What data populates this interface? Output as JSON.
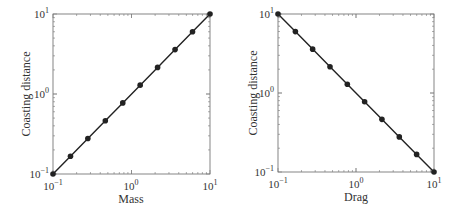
{
  "chart_data": [
    {
      "type": "line",
      "title": "",
      "xlabel": "Mass",
      "ylabel": "Coasting distance",
      "xscale": "log",
      "yscale": "log",
      "xlim": [
        0.1,
        10
      ],
      "ylim": [
        0.1,
        10
      ],
      "xticks": [
        "10^-1",
        "10^0",
        "10^1"
      ],
      "yticks": [
        "10^-1",
        "10^0",
        "10^1"
      ],
      "grid": false,
      "legend": null,
      "series": [
        {
          "name": "coasting distance vs mass",
          "marker": "circle",
          "x": [
            0.1,
            0.167,
            0.278,
            0.464,
            0.774,
            1.29,
            2.15,
            3.59,
            5.99,
            10
          ],
          "y": [
            0.1,
            0.167,
            0.278,
            0.464,
            0.774,
            1.29,
            2.15,
            3.59,
            5.99,
            10
          ]
        }
      ]
    },
    {
      "type": "line",
      "title": "",
      "xlabel": "Drag",
      "ylabel": "Coasting distance",
      "xscale": "log",
      "yscale": "log",
      "xlim": [
        0.1,
        10
      ],
      "ylim": [
        0.1,
        10
      ],
      "xticks": [
        "10^-1",
        "10^0",
        "10^1"
      ],
      "yticks": [
        "10^-1",
        "10^0",
        "10^1"
      ],
      "grid": false,
      "legend": null,
      "series": [
        {
          "name": "coasting distance vs drag",
          "marker": "circle",
          "x": [
            0.1,
            0.167,
            0.278,
            0.464,
            0.774,
            1.29,
            2.15,
            3.59,
            5.99,
            10
          ],
          "y": [
            10,
            5.99,
            3.59,
            2.15,
            1.29,
            0.774,
            0.464,
            0.278,
            0.167,
            0.1
          ]
        }
      ]
    }
  ],
  "labels": {
    "left_xlabel": "Mass",
    "right_xlabel": "Drag",
    "ylabel": "Coasting distance",
    "tick_base": "10",
    "exp_neg1": "−1",
    "exp_0": "0",
    "exp_1": "1"
  },
  "colors": {
    "line": "#222222",
    "axis": "#555555",
    "text": "#333333"
  }
}
